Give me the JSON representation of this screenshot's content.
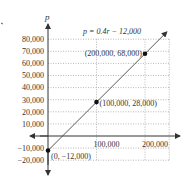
{
  "chart_data": {
    "type": "line",
    "title": "",
    "xlabel": "r",
    "ylabel": "p",
    "equation_label": "p = 0.4r − 12,000",
    "series": [
      {
        "name": "p = 0.4r − 12,000",
        "x": [
          0,
          100000,
          200000
        ],
        "y": [
          -12000,
          28000,
          68000
        ]
      }
    ],
    "points": [
      {
        "x": 0,
        "y": -12000,
        "label": "(0, −12,000)"
      },
      {
        "x": 100000,
        "y": 28000,
        "label": "(100,000, 28,000)"
      },
      {
        "x": 200000,
        "y": 68000,
        "label": "(200,000, 68,000)"
      }
    ],
    "x_ticks": [
      100000,
      200000
    ],
    "x_tick_labels": [
      "100,000",
      "200,000"
    ],
    "y_ticks": [
      80000,
      70000,
      60000,
      50000,
      40000,
      30000,
      20000,
      10000,
      -10000,
      -20000
    ],
    "y_tick_labels": [
      "80,000",
      "70,000",
      "60,000",
      "50,000",
      "40,000",
      "30,000",
      "20,000",
      "10,000",
      "−10,000",
      "−20,000"
    ],
    "xlim": [
      0,
      250000
    ],
    "ylim": [
      -20000,
      80000
    ],
    "grid": true,
    "grid_style": "dotted",
    "legend": "none"
  },
  "colors": {
    "axis": "#333333",
    "grid": "#999999",
    "line": "#444444",
    "point": "#111111"
  }
}
